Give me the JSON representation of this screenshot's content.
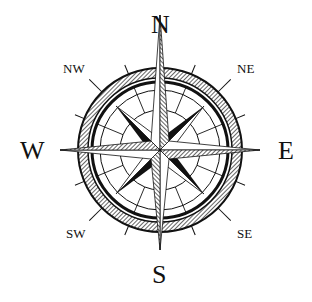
{
  "compass": {
    "labels": {
      "n": "N",
      "s": "S",
      "e": "E",
      "w": "W",
      "ne": "NE",
      "nw": "NW",
      "se": "SE",
      "sw": "SW"
    },
    "colors": {
      "ink": "#111111",
      "background": "#ffffff"
    }
  }
}
